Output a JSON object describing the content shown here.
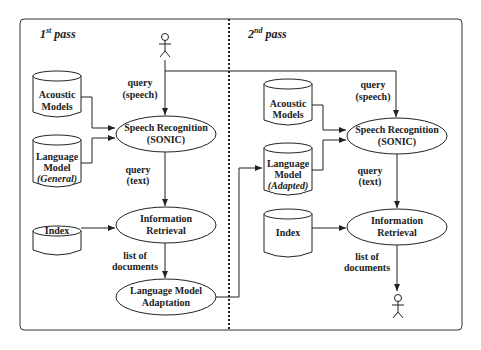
{
  "diagram": {
    "passes": [
      {
        "title_main": "1",
        "title_sup": "st",
        "title_rest": " pass",
        "actor_top": "user",
        "databases": [
          {
            "line1": "Acoustic",
            "line2": "Models",
            "line3": ""
          },
          {
            "line1": "Language",
            "line2": "Model",
            "line3": "(General)"
          },
          {
            "line1": "Index",
            "line2": "",
            "line3": ""
          }
        ],
        "processes": [
          {
            "line1": "Speech Recognition",
            "line2": "(SONIC)"
          },
          {
            "line1": "Information",
            "line2": "Retrieval"
          },
          {
            "line1": "Language Model",
            "line2": "Adaptation"
          }
        ],
        "edge_labels": [
          {
            "line1": "query",
            "line2": "(speech)"
          },
          {
            "line1": "query",
            "line2": "(text)"
          },
          {
            "line1": "list of",
            "line2": "documents"
          }
        ]
      },
      {
        "title_main": "2",
        "title_sup": "nd",
        "title_rest": " pass",
        "actor_bottom": "user",
        "databases": [
          {
            "line1": "Acoustic",
            "line2": "Models",
            "line3": ""
          },
          {
            "line1": "Language",
            "line2": "Model",
            "line3": "(Adapted)"
          },
          {
            "line1": "Index",
            "line2": "",
            "line3": ""
          }
        ],
        "processes": [
          {
            "line1": "Speech Recognition",
            "line2": "(SONIC)"
          },
          {
            "line1": "Information",
            "line2": "Retrieval"
          }
        ],
        "edge_labels": [
          {
            "line1": "query",
            "line2": "(speech)"
          },
          {
            "line1": "query",
            "line2": "(text)"
          },
          {
            "line1": "list of",
            "line2": "documents"
          }
        ]
      }
    ],
    "colors": {
      "stroke": "#222222",
      "background": "#ffffff"
    }
  }
}
